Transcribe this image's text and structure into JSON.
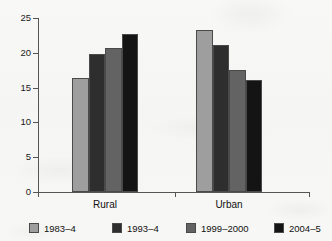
{
  "chart_data": {
    "type": "bar",
    "title": "",
    "subtitle": "",
    "xlabel": "",
    "ylabel": "",
    "categories": [
      "Rural",
      "Urban"
    ],
    "series": [
      {
        "name": "1983–4",
        "color": "#9e9e9e",
        "values": [
          16.4,
          23.3
        ]
      },
      {
        "name": "1993–4",
        "color": "#2e2e2e",
        "values": [
          19.8,
          21.1
        ]
      },
      {
        "name": "1999–2000",
        "color": "#636363",
        "values": [
          20.7,
          17.5
        ]
      },
      {
        "name": "2004–5",
        "color": "#141414",
        "values": [
          22.7,
          16.1
        ]
      }
    ],
    "ylim": [
      0,
      25
    ],
    "yticks": [
      0,
      5,
      10,
      15,
      20,
      25
    ],
    "ytick_labels": [
      "0",
      "5",
      "10",
      "15",
      "20",
      "25"
    ],
    "grid": false,
    "legend_position": "bottom"
  },
  "axis": {
    "y_labels": [
      "25",
      "20",
      "15",
      "10",
      "5",
      "0"
    ]
  },
  "groups": {
    "rural_label": "Rural",
    "urban_label": "Urban"
  },
  "legend": {
    "items": [
      {
        "label": "1983–4"
      },
      {
        "label": "1993–4"
      },
      {
        "label": "1999–2000"
      },
      {
        "label": "2004–5"
      }
    ]
  }
}
